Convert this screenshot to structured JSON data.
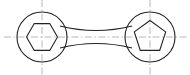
{
  "drawing": {
    "title": "two-boss connecting link technical drawing",
    "description": "Orthographic line drawing of a dumbbell-shaped connecting link: two circular bosses joined by a waisted bar, left boss with hexagonal through-hole, right boss with pentagonal through-hole, dash-dot centerlines",
    "canvas": {
      "width": 190,
      "height": 75,
      "background": "#ffffff"
    },
    "style": {
      "outline_color": "#222222",
      "outline_width": 1.1,
      "centerline_color": "#b0b0b0",
      "centerline_width": 0.9,
      "centerline_dash": "7 2.5 1.5 2.5"
    },
    "left_boss": {
      "name": "circle with hexagonal hole",
      "center_x": 42,
      "center_y": 37,
      "radius": 25
    },
    "right_boss": {
      "name": "circle with pentagonal hole",
      "center_x": 150,
      "center_y": 37,
      "radius": 25
    },
    "hexagon": {
      "name": "hexagonal hole",
      "center_x": 42,
      "center_y": 37,
      "radius": 15.5,
      "sides": 6,
      "rotation_deg": 0,
      "orientation": "vertex left and right, flats top and bottom"
    },
    "pentagon": {
      "name": "pentagonal hole",
      "center_x": 150,
      "center_y": 37,
      "radius": 16.5,
      "sides": 5,
      "rotation_deg": -90,
      "orientation": "apex up, flat bottom"
    },
    "connecting_bar": {
      "name": "waisted connecting bar",
      "left_x": 60,
      "right_x": 132,
      "half_height_at_ends": 11,
      "half_height_at_center": 6.5,
      "profile": "concave waisted / hourglass"
    },
    "centerlines": {
      "horizontal": {
        "y": 37,
        "x_start": 4,
        "x_end": 188
      },
      "vertical_left": {
        "x": 42,
        "y_start": 0,
        "y_end": 75
      },
      "vertical_right": {
        "x": 150,
        "y_start": 0,
        "y_end": 75
      }
    }
  }
}
